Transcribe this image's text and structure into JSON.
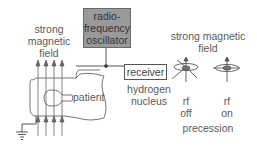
{
  "diagram": {
    "left_field_label": [
      "strong",
      "magnetic",
      "field"
    ],
    "oscillator_label": [
      "radio-",
      "frequency",
      "oscillator"
    ],
    "receiver_label": "receiver",
    "patient_label": "patient",
    "right_field_label": [
      "strong magnetic",
      "field"
    ],
    "nucleus_label": [
      "hydrogen",
      "nucleus"
    ],
    "rf_off_label": [
      "rf",
      "off"
    ],
    "rf_on_label": [
      "rf",
      "on"
    ],
    "precession_label": "precession"
  },
  "colors": {
    "oscillator_fill": "#9a9a9a",
    "line": "#555555",
    "text": "#5a5a5a"
  }
}
